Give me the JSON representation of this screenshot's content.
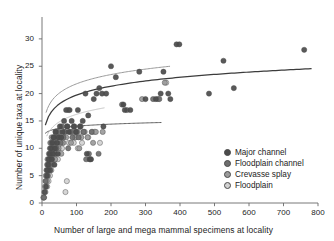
{
  "chart_data": {
    "type": "scatter",
    "title": "",
    "xlabel": "Number of large and mega mammal specimens at locality",
    "ylabel": "Number of unique taxa at locality",
    "xlim": [
      0,
      800
    ],
    "ylim": [
      0,
      34
    ],
    "xticks": [
      0,
      100,
      200,
      300,
      400,
      500,
      600,
      700,
      800
    ],
    "yticks": [
      0,
      5,
      10,
      15,
      20,
      25,
      30
    ],
    "grid": false,
    "legend_position": "lower-right",
    "legend": [
      {
        "label": "Major channel",
        "color": "#4b4b4b"
      },
      {
        "label": "Floodplain channel",
        "color": "#6e6e6e"
      },
      {
        "label": "Crevasse splay",
        "color": "#9b9b9b"
      },
      {
        "label": "Floodplain",
        "color": "#d2d2d2"
      }
    ],
    "series": [
      {
        "name": "Major channel",
        "color": "#4b4b4b",
        "points": [
          [
            8,
            2
          ],
          [
            12,
            3
          ],
          [
            14,
            5
          ],
          [
            16,
            6
          ],
          [
            18,
            7
          ],
          [
            20,
            8
          ],
          [
            22,
            9
          ],
          [
            24,
            6
          ],
          [
            26,
            10
          ],
          [
            28,
            8
          ],
          [
            30,
            11
          ],
          [
            32,
            9
          ],
          [
            34,
            12
          ],
          [
            36,
            7
          ],
          [
            38,
            10
          ],
          [
            40,
            13
          ],
          [
            44,
            11
          ],
          [
            46,
            9
          ],
          [
            48,
            12
          ],
          [
            52,
            14
          ],
          [
            56,
            12
          ],
          [
            60,
            13
          ],
          [
            64,
            15
          ],
          [
            70,
            17
          ],
          [
            74,
            14
          ],
          [
            78,
            13
          ],
          [
            80,
            17
          ],
          [
            86,
            15
          ],
          [
            92,
            14
          ],
          [
            98,
            13
          ],
          [
            104,
            17
          ],
          [
            110,
            14
          ],
          [
            118,
            15
          ],
          [
            126,
            20
          ],
          [
            130,
            9
          ],
          [
            134,
            16
          ],
          [
            138,
            8
          ],
          [
            142,
            8
          ],
          [
            150,
            19
          ],
          [
            158,
            20
          ],
          [
            166,
            21
          ],
          [
            174,
            20
          ],
          [
            178,
            14
          ],
          [
            186,
            20
          ],
          [
            200,
            25
          ],
          [
            214,
            23
          ],
          [
            236,
            18
          ],
          [
            240,
            17
          ],
          [
            256,
            17
          ],
          [
            282,
            24
          ],
          [
            300,
            19
          ],
          [
            330,
            19
          ],
          [
            344,
            20
          ],
          [
            352,
            24
          ],
          [
            366,
            20
          ],
          [
            372,
            19
          ],
          [
            390,
            29
          ],
          [
            398,
            29
          ],
          [
            484,
            20
          ],
          [
            526,
            26
          ],
          [
            556,
            21
          ],
          [
            760,
            28
          ]
        ]
      },
      {
        "name": "Floodplain channel",
        "color": "#6e6e6e",
        "points": [
          [
            6,
            1
          ],
          [
            10,
            4
          ],
          [
            13,
            6
          ],
          [
            15,
            7
          ],
          [
            17,
            5
          ],
          [
            19,
            8
          ],
          [
            21,
            7
          ],
          [
            23,
            10
          ],
          [
            25,
            9
          ],
          [
            27,
            11
          ],
          [
            29,
            8
          ],
          [
            31,
            10
          ],
          [
            33,
            12
          ],
          [
            35,
            11
          ],
          [
            37,
            9
          ],
          [
            39,
            13
          ],
          [
            42,
            10
          ],
          [
            45,
            12
          ],
          [
            50,
            13
          ],
          [
            54,
            11
          ],
          [
            58,
            14
          ],
          [
            62,
            12
          ],
          [
            66,
            13
          ],
          [
            72,
            14
          ],
          [
            76,
            10
          ],
          [
            82,
            13
          ],
          [
            88,
            12
          ],
          [
            94,
            14
          ],
          [
            100,
            13
          ],
          [
            106,
            12
          ],
          [
            112,
            14
          ],
          [
            120,
            13
          ],
          [
            128,
            8
          ],
          [
            136,
            9
          ],
          [
            144,
            13
          ],
          [
            164,
            9
          ],
          [
            232,
            18
          ],
          [
            246,
            17
          ],
          [
            322,
            19
          ],
          [
            340,
            19
          ]
        ]
      },
      {
        "name": "Crevasse splay",
        "color": "#9b9b9b",
        "points": [
          [
            5,
            1
          ],
          [
            9,
            3
          ],
          [
            11,
            5
          ],
          [
            14,
            4
          ],
          [
            16,
            8
          ],
          [
            18,
            6
          ],
          [
            20,
            9
          ],
          [
            22,
            8
          ],
          [
            24,
            11
          ],
          [
            26,
            7
          ],
          [
            28,
            12
          ],
          [
            30,
            9
          ],
          [
            33,
            10
          ],
          [
            36,
            12
          ],
          [
            38,
            8
          ],
          [
            41,
            11
          ],
          [
            44,
            13
          ],
          [
            48,
            10
          ],
          [
            52,
            12
          ],
          [
            56,
            9
          ],
          [
            60,
            11
          ],
          [
            66,
            13
          ],
          [
            70,
            12
          ],
          [
            76,
            17
          ],
          [
            84,
            11
          ],
          [
            90,
            13
          ],
          [
            96,
            12
          ],
          [
            102,
            13
          ],
          [
            108,
            10
          ],
          [
            114,
            12
          ],
          [
            122,
            13
          ],
          [
            132,
            12
          ],
          [
            140,
            8
          ],
          [
            148,
            11
          ],
          [
            156,
            13
          ],
          [
            176,
            13
          ],
          [
            290,
            19
          ],
          [
            336,
            19
          ],
          [
            356,
            22
          ]
        ]
      },
      {
        "name": "Floodplain",
        "color": "#d2d2d2",
        "points": [
          [
            4,
            1
          ],
          [
            7,
            2
          ],
          [
            10,
            2
          ],
          [
            12,
            4
          ],
          [
            15,
            3
          ],
          [
            17,
            6
          ],
          [
            19,
            4
          ],
          [
            21,
            7
          ],
          [
            23,
            5
          ],
          [
            25,
            8
          ],
          [
            27,
            6
          ],
          [
            29,
            9
          ],
          [
            31,
            7
          ],
          [
            34,
            10
          ],
          [
            37,
            8
          ],
          [
            40,
            9
          ],
          [
            43,
            11
          ],
          [
            46,
            8
          ],
          [
            50,
            10
          ],
          [
            54,
            12
          ],
          [
            58,
            10
          ],
          [
            62,
            11
          ],
          [
            68,
            2
          ],
          [
            72,
            4
          ],
          [
            78,
            11
          ],
          [
            86,
            13
          ],
          [
            92,
            11
          ],
          [
            98,
            12
          ],
          [
            104,
            10
          ],
          [
            110,
            13
          ],
          [
            116,
            11
          ],
          [
            124,
            13
          ],
          [
            134,
            12
          ],
          [
            146,
            13
          ],
          [
            152,
            13
          ],
          [
            168,
            11
          ],
          [
            360,
            22
          ]
        ]
      }
    ],
    "trend_curves": [
      {
        "name": "Major channel fit",
        "color": "#3c3c3c",
        "width": 1.25,
        "x_start": 10,
        "x_end": 780,
        "a": 2.35,
        "b": 8.9
      },
      {
        "name": "Floodplain channel fit",
        "color": "#5f5f5f",
        "width": 1.0,
        "x_start": 10,
        "x_end": 345,
        "a": 0.55,
        "b": 11.5
      },
      {
        "name": "Crevasse splay fit",
        "color": "#9a9a9a",
        "width": 1.0,
        "x_start": 12,
        "x_end": 370,
        "a": 2.45,
        "b": 10.5
      },
      {
        "name": "Floodplain fit",
        "color": "#c4c4c4",
        "width": 1.0,
        "x_start": 14,
        "x_end": 180,
        "a": 2.0,
        "b": 7.0
      }
    ]
  }
}
